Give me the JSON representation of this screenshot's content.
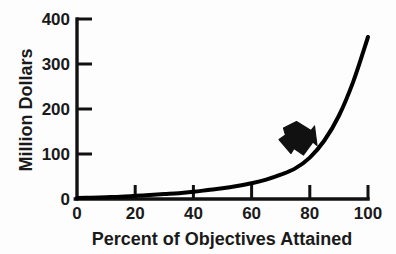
{
  "chart_data": {
    "type": "line",
    "title": "",
    "xlabel": "Percent of Objectives Attained",
    "ylabel": "Million Dollars",
    "xlim": [
      0,
      100
    ],
    "ylim": [
      0,
      400
    ],
    "xticks": [
      "0",
      "20",
      "40",
      "60",
      "80",
      "100"
    ],
    "xtick_values": [
      0,
      20,
      40,
      60,
      80,
      100
    ],
    "yticks": [
      "0",
      "100",
      "200",
      "300",
      "400"
    ],
    "ytick_values": [
      0,
      100,
      200,
      300,
      400
    ],
    "grid": false,
    "legend": null,
    "line_color": "#000000",
    "line_width": 4,
    "series": [
      {
        "name": "Cost",
        "x": [
          0,
          5,
          10,
          15,
          20,
          25,
          30,
          35,
          40,
          45,
          50,
          55,
          60,
          65,
          70,
          75,
          80,
          85,
          90,
          95,
          100
        ],
        "values": [
          2,
          3,
          4,
          5,
          7,
          9,
          11,
          13,
          16,
          20,
          24,
          29,
          35,
          43,
          54,
          68,
          92,
          130,
          185,
          262,
          360
        ]
      }
    ],
    "annotations": [
      {
        "name": "arrow-annotation",
        "kind": "block-arrow",
        "direction": "down-right",
        "color": "#111111",
        "points_to_x": 82,
        "points_to_y": 100
      }
    ]
  },
  "figure": {
    "background_color": "#fdfdfd",
    "axis_color": "#111111",
    "text_color": "#1a1a1a"
  }
}
